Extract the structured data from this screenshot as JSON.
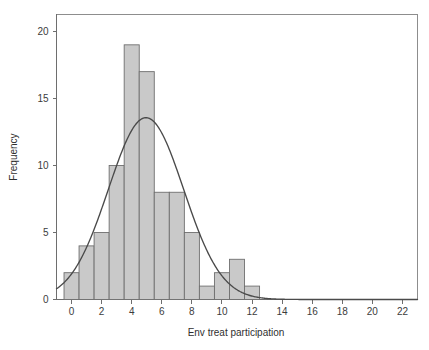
{
  "chart_data": {
    "type": "bar",
    "title": "",
    "subtitle": "",
    "xlabel": "Env treat participation",
    "ylabel": "Frequency",
    "xlim": [
      -1,
      23
    ],
    "ylim": [
      0,
      21.3
    ],
    "grid": false,
    "legend": null,
    "bin_width": 1,
    "categories": [
      0,
      1,
      2,
      3,
      4,
      5,
      6,
      7,
      8,
      9,
      10,
      11,
      12
    ],
    "bin_left_edges": [
      -0.5,
      0.5,
      1.5,
      2.5,
      3.5,
      4.5,
      5.5,
      6.5,
      7.5,
      8.5,
      9.5,
      10.5,
      11.5
    ],
    "bin_right_edges": [
      0.5,
      1.5,
      2.5,
      3.5,
      4.5,
      5.5,
      6.5,
      7.5,
      8.5,
      9.5,
      10.5,
      11.5,
      12.5
    ],
    "values": [
      2,
      4,
      5,
      10,
      19,
      17,
      8,
      8,
      5,
      1,
      2,
      3,
      1
    ],
    "total_count": 85,
    "xticks": [
      0,
      2,
      4,
      6,
      8,
      10,
      12,
      14,
      16,
      18,
      20,
      22
    ],
    "xtick_labels": [
      "0",
      "2",
      "4",
      "6",
      "8",
      "10",
      "12",
      "14",
      "16",
      "18",
      "20",
      "22"
    ],
    "yticks": [
      0,
      5,
      10,
      15,
      20
    ],
    "ytick_labels": [
      "0",
      "5",
      "10",
      "15",
      "20"
    ],
    "overlay": {
      "type": "normal-curve",
      "label": "Normal distribution fit",
      "mean": 4.95,
      "std_dev": 2.5,
      "peak_value": 13.6,
      "scale_n_times_binwidth": 85
    }
  },
  "axes": {
    "x_title": "Env treat participation",
    "y_title": "Frequency"
  }
}
